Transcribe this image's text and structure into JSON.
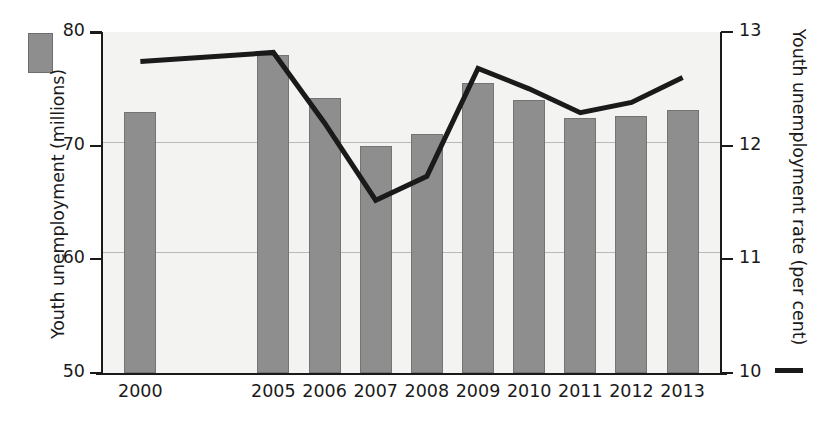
{
  "legend": {
    "bar_swatch_name": "youth-unemployment-millions-swatch",
    "line_swatch_name": "youth-unemployment-rate-line-swatch",
    "bar_color": "#8e8e8e",
    "line_color": "#1a1a1a"
  },
  "axes": {
    "left": {
      "title": "Youth unemployment (millions)",
      "ticks": [
        "50",
        "60",
        "70",
        "80"
      ],
      "min": 50,
      "max": 80
    },
    "right": {
      "title": "Youth unemployment rate (per cent)",
      "ticks": [
        "10",
        "11",
        "12",
        "13"
      ],
      "min": 10,
      "max": 13
    }
  },
  "chart_data": {
    "type": "bar",
    "title": "",
    "xlabel": "",
    "ylabel": "Youth unemployment (millions)",
    "y2label": "Youth unemployment rate (per cent)",
    "categories": [
      "2000",
      "2005",
      "2006",
      "2007",
      "2008",
      "2009",
      "2010",
      "2011",
      "2012",
      "2013"
    ],
    "grid": true,
    "legend_position": "outside",
    "ylim": [
      50,
      80
    ],
    "y2lim": [
      10,
      13
    ],
    "series": [
      {
        "name": "Youth unemployment (millions)",
        "type": "bar",
        "axis": "left",
        "color": "#8e8e8e",
        "values": [
          73.0,
          78.0,
          74.2,
          70.0,
          71.0,
          75.5,
          74.0,
          72.4,
          72.6,
          73.1
        ]
      },
      {
        "name": "Youth unemployment rate (per cent)",
        "type": "line",
        "axis": "right",
        "color": "#1a1a1a",
        "values": [
          12.74,
          12.82,
          12.2,
          11.52,
          11.73,
          12.68,
          12.5,
          12.29,
          12.38,
          12.6
        ]
      }
    ]
  }
}
